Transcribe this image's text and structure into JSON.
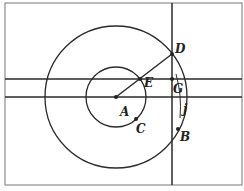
{
  "diagram": {
    "type": "geometry-construction",
    "colors": {
      "stroke": "#2a2a2a",
      "frame": "#777777",
      "background": "#ffffff"
    },
    "frame": {
      "x": 5,
      "y": 3,
      "w": 237,
      "h": 182
    },
    "circles": [
      {
        "name": "small-circle",
        "center": "A",
        "cx": 116,
        "cy": 97,
        "r": 30
      },
      {
        "name": "large-circle",
        "center": "A",
        "cx": 116,
        "cy": 97,
        "r": 71
      }
    ],
    "lines": [
      {
        "name": "horizontal-line-upper",
        "x1": 5,
        "y1": 79,
        "x2": 242,
        "y2": 79
      },
      {
        "name": "horizontal-line-lower",
        "x1": 5,
        "y1": 97,
        "x2": 242,
        "y2": 97
      },
      {
        "name": "vertical-line",
        "x1": 172,
        "y1": 3,
        "x2": 172,
        "y2": 185
      },
      {
        "name": "segment-AD",
        "x1": 116,
        "y1": 97,
        "x2": 172,
        "y2": 54
      }
    ],
    "points": [
      {
        "name": "A",
        "label": "A",
        "x": 116,
        "y": 97,
        "lx": 120,
        "ly": 116
      },
      {
        "name": "C",
        "label": "C",
        "x": 136,
        "y": 119,
        "lx": 136,
        "ly": 133
      },
      {
        "name": "E",
        "label": "E",
        "x": 140,
        "y": 79,
        "lx": 144,
        "ly": 87
      },
      {
        "name": "D",
        "label": "D",
        "x": 172,
        "y": 54,
        "lx": 175,
        "ly": 53
      },
      {
        "name": "G",
        "label": "G",
        "x": 172,
        "y": 79,
        "lx": 173,
        "ly": 93
      },
      {
        "name": "B",
        "label": "B",
        "x": 178,
        "y": 129,
        "lx": 180,
        "ly": 141
      }
    ],
    "arc_label": {
      "label": "j",
      "x": 183,
      "y": 113
    }
  }
}
